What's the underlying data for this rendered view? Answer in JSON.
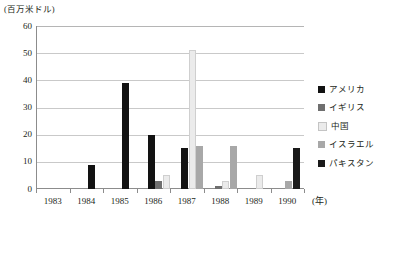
{
  "chart_data": {
    "type": "bar",
    "title": "",
    "subtitle": "",
    "ylabel": "(百万米ドル)",
    "xlabel": "(年)",
    "categories": [
      "1983",
      "1984",
      "1985",
      "1986",
      "1987",
      "1988",
      "1989",
      "1990"
    ],
    "ylim": [
      0,
      60
    ],
    "yticks": [
      "0",
      "10",
      "20",
      "30",
      "40",
      "50",
      "60"
    ],
    "ytick_values": [
      0,
      10,
      20,
      30,
      40,
      50,
      60
    ],
    "grid": true,
    "legend_position": "right",
    "series": [
      {
        "name": "アメリカ",
        "color": "#121212",
        "values": [
          0,
          9,
          39,
          20,
          15,
          0,
          0,
          0
        ]
      },
      {
        "name": "イギリス",
        "color": "#6f6f6f",
        "values": [
          0,
          0,
          0,
          3,
          0,
          1,
          0,
          0
        ]
      },
      {
        "name": "中国",
        "color": "#ebebeb",
        "values": [
          0,
          0,
          0,
          5,
          51,
          3,
          5,
          0
        ]
      },
      {
        "name": "イスラエル",
        "color": "#a8a8a8",
        "values": [
          0,
          0,
          0,
          0,
          16,
          16,
          0,
          3
        ]
      },
      {
        "name": "パキスタン",
        "color": "#1a1a1a",
        "values": [
          0,
          0,
          0,
          0,
          0,
          0,
          0,
          15
        ]
      }
    ]
  },
  "legend": {
    "items": [
      {
        "label": "アメリカ",
        "color": "#121212"
      },
      {
        "label": "イギリス",
        "color": "#6f6f6f"
      },
      {
        "label": "中国",
        "color": "#ebebeb"
      },
      {
        "label": "イスラエル",
        "color": "#a8a8a8"
      },
      {
        "label": "パキスタン",
        "color": "#1a1a1a"
      }
    ]
  }
}
